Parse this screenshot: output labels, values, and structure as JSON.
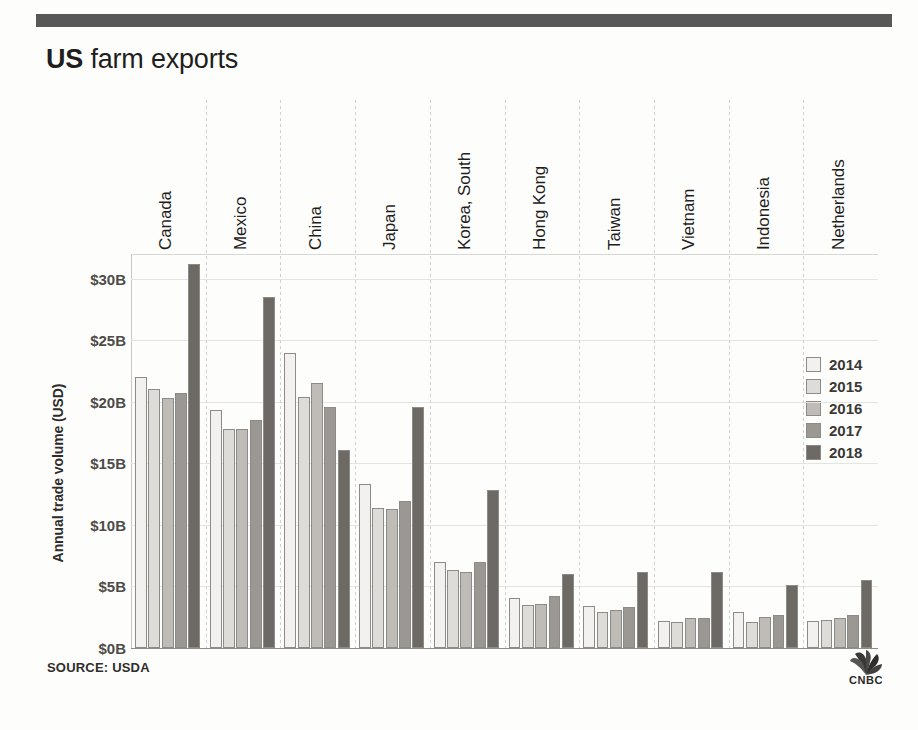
{
  "header": {
    "title_strong": "US",
    "title_rest": " farm exports"
  },
  "footer": {
    "source": "SOURCE: USDA",
    "brand": "CNBC",
    "brand_icon": "cnbc-peacock-icon"
  },
  "legend": {
    "position": "right",
    "entries": [
      {
        "label": "2014",
        "color": "#f2f1ef"
      },
      {
        "label": "2015",
        "color": "#dedcd8"
      },
      {
        "label": "2016",
        "color": "#bfbcb7"
      },
      {
        "label": "2017",
        "color": "#9b9894"
      },
      {
        "label": "2018",
        "color": "#6d6a66"
      }
    ]
  },
  "chart_data": {
    "type": "bar",
    "title": "US farm exports",
    "xlabel": "",
    "ylabel": "Annual trade volume (USD)",
    "ylim": [
      0,
      32
    ],
    "ytick_values": [
      0,
      5,
      10,
      15,
      20,
      25,
      30
    ],
    "ytick_labels": [
      "$0B",
      "$5B",
      "$10B",
      "$15B",
      "$20B",
      "$25B",
      "$30B"
    ],
    "grid": true,
    "legend_position": "right",
    "value_unit": "billion USD",
    "categories": [
      "Canada",
      "Mexico",
      "China",
      "Japan",
      "Korea, South",
      "Hong Kong",
      "Taiwan",
      "Vietnam",
      "Indonesia",
      "Netherlands"
    ],
    "series": [
      {
        "name": "2014",
        "color": "#f2f1ef",
        "values": [
          22.0,
          19.3,
          24.0,
          13.3,
          7.0,
          4.1,
          3.4,
          2.2,
          2.9,
          2.2
        ]
      },
      {
        "name": "2015",
        "color": "#dedcd8",
        "values": [
          21.0,
          17.8,
          20.4,
          11.4,
          6.3,
          3.5,
          2.9,
          2.1,
          2.1,
          2.3
        ]
      },
      {
        "name": "2016",
        "color": "#bfbcb7",
        "values": [
          20.3,
          17.8,
          21.5,
          11.3,
          6.2,
          3.6,
          3.1,
          2.4,
          2.5,
          2.4
        ]
      },
      {
        "name": "2017",
        "color": "#9b9894",
        "values": [
          20.7,
          18.5,
          19.6,
          11.9,
          7.0,
          4.2,
          3.3,
          2.4,
          2.7,
          2.7
        ]
      },
      {
        "name": "2018",
        "color": "#6d6a66",
        "values": [
          31.2,
          28.5,
          16.1,
          19.6,
          12.8,
          6.0,
          6.2,
          6.2,
          5.1,
          5.5
        ]
      }
    ]
  }
}
